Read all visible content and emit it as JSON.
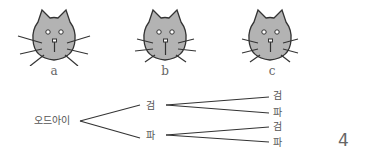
{
  "cats": [
    {
      "label": "a",
      "variant": "whiskers-wide"
    },
    {
      "label": "b",
      "variant": "whiskers-medium"
    },
    {
      "label": "c",
      "variant": "whiskers-medium"
    }
  ],
  "tree": {
    "root": "오드아이",
    "level1": [
      {
        "label": "검",
        "children": [
          "검",
          "파"
        ]
      },
      {
        "label": "파",
        "children": [
          "검",
          "파"
        ]
      }
    ]
  },
  "page_number": "4",
  "colors": {
    "cat_fill": "#b3b3b3",
    "stroke": "#333333",
    "text": "#555555"
  }
}
